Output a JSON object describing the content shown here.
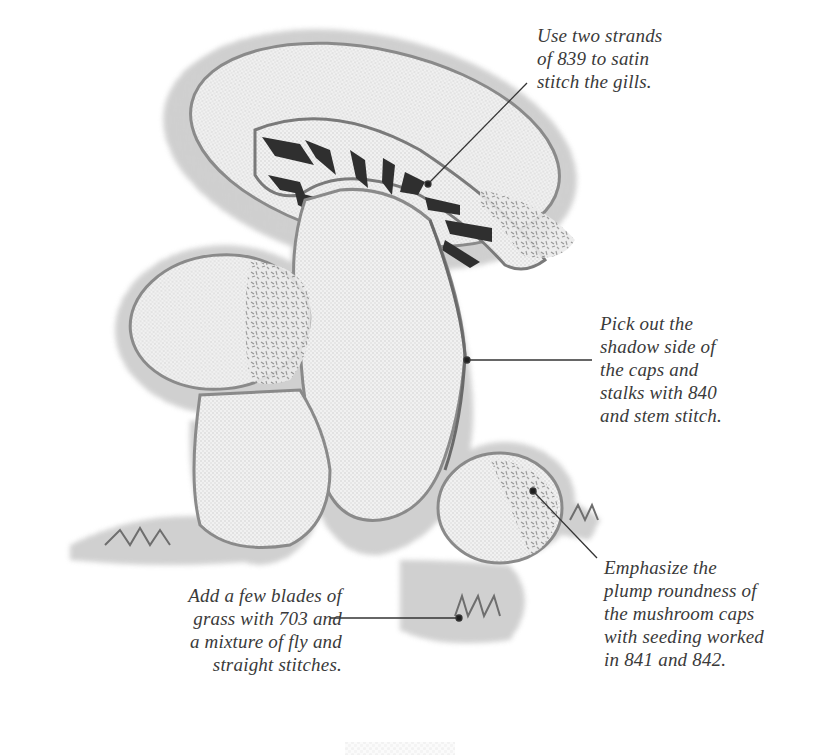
{
  "figure": {
    "colors": {
      "background": "#ffffff",
      "linen_fill": "#efefef",
      "linen_texture": "#bdbdbd",
      "outline_stem_stitch": "#7a7a7a",
      "gills_satin": "#2f2f2f",
      "seeding": "#8c8c8c",
      "grass": "#6e6e6e",
      "leader_line": "#333333",
      "text": "#3a3a3a"
    }
  },
  "annotations": [
    {
      "id": "gills",
      "lines": [
        "Use two strands",
        "of 839 to satin",
        "stitch the gills."
      ]
    },
    {
      "id": "shadow",
      "lines": [
        "Pick out the",
        "shadow side of",
        "the caps and",
        "stalks with 840",
        "and stem stitch."
      ]
    },
    {
      "id": "seeding",
      "lines": [
        "Emphasize the",
        "plump roundness of",
        "the mushroom caps",
        "with seeding worked",
        "in 841 and 842."
      ]
    },
    {
      "id": "grass",
      "lines": [
        "Add a few blades of",
        "grass with 703 and",
        "a mixture of fly and",
        "straight stitches."
      ]
    }
  ],
  "thread_numbers": {
    "gills": "839",
    "shadow": "840",
    "seeding": [
      "841",
      "842"
    ],
    "grass": "703"
  }
}
